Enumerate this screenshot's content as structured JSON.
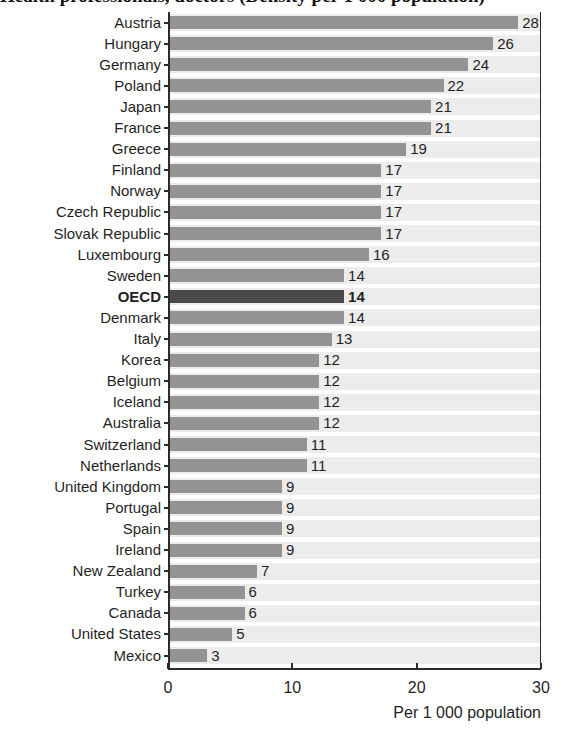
{
  "chart_data": {
    "type": "bar",
    "orientation": "horizontal",
    "title": "Health professionals, doctors (Density per 1 000 population)",
    "xlabel": "Per 1 000 population",
    "ylabel": "",
    "xlim": [
      0,
      30
    ],
    "xticks": [
      0,
      10,
      20,
      30
    ],
    "xtick_labels": [
      "0",
      "10",
      "20",
      "30"
    ],
    "grid": false,
    "legend": "none",
    "highlight_category": "OECD",
    "categories": [
      "Austria",
      "Hungary",
      "Germany",
      "Poland",
      "Japan",
      "France",
      "Greece",
      "Finland",
      "Norway",
      "Czech Republic",
      "Slovak Republic",
      "Luxembourg",
      "Sweden",
      "OECD",
      "Denmark",
      "Italy",
      "Korea",
      "Belgium",
      "Iceland",
      "Australia",
      "Switzerland",
      "Netherlands",
      "United Kingdom",
      "Portugal",
      "Spain",
      "Ireland",
      "New Zealand",
      "Turkey",
      "Canada",
      "United States",
      "Mexico"
    ],
    "values": [
      28,
      26,
      24,
      22,
      21,
      21,
      19,
      17,
      17,
      17,
      17,
      16,
      14,
      14,
      14,
      13,
      12,
      12,
      12,
      12,
      11,
      11,
      9,
      9,
      9,
      9,
      7,
      6,
      6,
      5,
      3
    ],
    "value_labels": [
      "28",
      "26",
      "24",
      "22",
      "21",
      "21",
      "19",
      "17",
      "17",
      "17",
      "17",
      "16",
      "14",
      "14",
      "14",
      "13",
      "12",
      "12",
      "12",
      "12",
      "11",
      "11",
      "9",
      "9",
      "9",
      "9",
      "7",
      "6",
      "6",
      "5",
      "3"
    ],
    "colors": {
      "bar": "#939393",
      "bar_highlight": "#4a4a4a",
      "row_band": "#ececec",
      "axis": "#2b2b2b",
      "text": "#1f1f1f"
    }
  }
}
